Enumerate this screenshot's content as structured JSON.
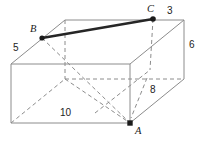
{
  "figure": {
    "shape": "rectangular-prism",
    "background_color": "#ffffff",
    "edge_color": "#8c8c8c",
    "hidden_edge_color": "#8c8c8c",
    "highlight_color": "#262626",
    "vertex_dot_color": "#1a1a1a"
  },
  "vertices": [
    {
      "id": "A",
      "label": "A",
      "x": 130,
      "y": 123,
      "dot": true
    },
    {
      "id": "B",
      "label": "B",
      "x": 42,
      "y": 38,
      "dot": true
    },
    {
      "id": "C",
      "label": "C",
      "x": 153,
      "y": 19,
      "dot": true
    }
  ],
  "labels": {
    "vertex_a": "A",
    "vertex_b": "B",
    "vertex_c": "C",
    "dim_5": "5",
    "dim_3": "3",
    "dim_6": "6",
    "dim_8": "8",
    "dim_10": "10"
  },
  "dimensions": [
    {
      "name": "left-top-edge",
      "value": "5",
      "x": 14,
      "y": 44
    },
    {
      "name": "back-top-right-edge",
      "value": "3",
      "x": 167,
      "y": 7
    },
    {
      "name": "right-vertical-edge",
      "value": "6",
      "x": 189,
      "y": 41
    },
    {
      "name": "right-lower-diagonal",
      "value": "8",
      "x": 150,
      "y": 85
    },
    {
      "name": "front-bottom-edge",
      "value": "10",
      "x": 60,
      "y": 109
    }
  ],
  "geometry": {
    "front_top_left": {
      "x": 11,
      "y": 64
    },
    "front_top_right": {
      "x": 130,
      "y": 64
    },
    "front_bottom_left": {
      "x": 11,
      "y": 123
    },
    "front_bottom_right": {
      "x": 130,
      "y": 123
    },
    "back_top_left": {
      "x": 65,
      "y": 20
    },
    "back_top_right": {
      "x": 184,
      "y": 20
    },
    "back_bottom_left": {
      "x": 65,
      "y": 79
    },
    "back_bottom_right": {
      "x": 184,
      "y": 79
    }
  }
}
